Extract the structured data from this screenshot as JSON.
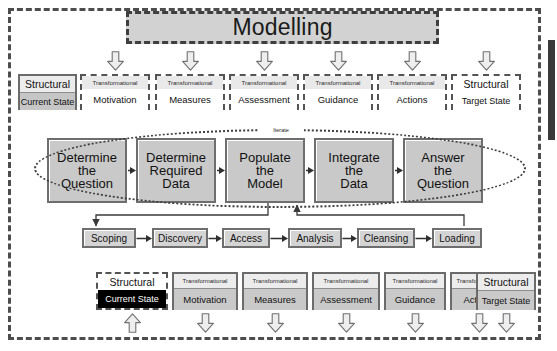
{
  "diagram": {
    "title": "Modelling",
    "iterate_label": "Iterate",
    "labels": {
      "structural": "Structural",
      "transformational": "Transformational"
    },
    "colors": {
      "frame_border": "#4d4d4d",
      "banner_fill": "#d2d2d2",
      "process_fill": "#c9c9c9",
      "pipeline_fill": "#d4d4d4",
      "card_body_fill": "#c9c9c9",
      "current_state_fill": "#000000",
      "current_state_text": "#ffffff",
      "edge_bar": "#3a3a3a"
    },
    "top_row": [
      {
        "kind": "structural",
        "header": "Structural",
        "body": "Current State",
        "style": "solid",
        "arrow": false
      },
      {
        "kind": "transformational",
        "header": "Transformational",
        "body": "Motivation",
        "style": "dashed",
        "arrow": true
      },
      {
        "kind": "transformational",
        "header": "Transformational",
        "body": "Measures",
        "style": "dashed",
        "arrow": true
      },
      {
        "kind": "transformational",
        "header": "Transformational",
        "body": "Assessment",
        "style": "dashed",
        "arrow": true
      },
      {
        "kind": "transformational",
        "header": "Transformational",
        "body": "Guidance",
        "style": "dashed",
        "arrow": true
      },
      {
        "kind": "transformational",
        "header": "Transformational",
        "body": "Actions",
        "style": "dashed",
        "arrow": true
      },
      {
        "kind": "structural",
        "header": "Structural",
        "body": "Target State",
        "style": "dashed",
        "arrow": true
      }
    ],
    "process_row": [
      {
        "lines": [
          "Determine",
          "the",
          "Question"
        ]
      },
      {
        "lines": [
          "Determine",
          "Required",
          "Data"
        ]
      },
      {
        "lines": [
          "Populate",
          "the",
          "Model"
        ]
      },
      {
        "lines": [
          "Integrate",
          "the",
          "Data"
        ]
      },
      {
        "lines": [
          "Answer",
          "the",
          "Question"
        ]
      }
    ],
    "pipeline_row": [
      {
        "label": "Scoping"
      },
      {
        "label": "Discovery"
      },
      {
        "label": "Access"
      },
      {
        "label": "Analysis"
      },
      {
        "label": "Cleansing"
      },
      {
        "label": "Loading"
      }
    ],
    "bottom_row": [
      {
        "kind": "structural",
        "header": "Structural",
        "body": "Current State",
        "style": "black",
        "arrow": "up"
      },
      {
        "kind": "transformational",
        "header": "Transformational",
        "body": "Motivation",
        "style": "solid",
        "arrow": "down"
      },
      {
        "kind": "transformational",
        "header": "Transformational",
        "body": "Measures",
        "style": "solid",
        "arrow": "down"
      },
      {
        "kind": "transformational",
        "header": "Transformational",
        "body": "Assessment",
        "style": "solid",
        "arrow": "down"
      },
      {
        "kind": "transformational",
        "header": "Transformational",
        "body": "Guidance",
        "style": "solid",
        "arrow": "down"
      },
      {
        "kind": "transformational",
        "header": "Transformational",
        "body": "Actions",
        "style": "solid",
        "arrow": "down"
      },
      {
        "kind": "structural",
        "header": "Structural",
        "body": "Target State",
        "style": "solid",
        "arrow": "down"
      }
    ]
  }
}
